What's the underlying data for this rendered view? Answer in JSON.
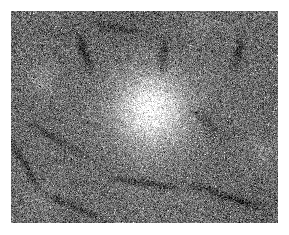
{
  "canvas": {
    "width": 289,
    "height": 235,
    "background_color": "#ffffff"
  },
  "image_panel": {
    "label": "grayscale-speckle-image",
    "x": 11,
    "y": 11,
    "width": 267,
    "height": 212,
    "base_gray_level": 108,
    "speckle_contrast": 78,
    "border_color": "#ffffff",
    "colormap": "grayscale"
  },
  "features": {
    "bright_lesion": {
      "label": "central-bright-lesion",
      "center_x": 150,
      "center_y": 110,
      "radius_x": 36,
      "radius_y": 38,
      "peak_brightness": 216,
      "falloff": "gaussian"
    },
    "bright_halo": {
      "label": "lesion-halo",
      "center_x": 150,
      "center_y": 106,
      "radius_x": 62,
      "radius_y": 60,
      "peak_brightness": 150
    },
    "dark_structures": [
      {
        "label": "dark-streak-upper-left",
        "center_x": 84,
        "center_y": 52,
        "length": 30,
        "thickness": 9,
        "angle_deg": 72,
        "darkness": 56
      },
      {
        "label": "dark-patch-upper-center",
        "center_x": 163,
        "center_y": 55,
        "length": 26,
        "thickness": 11,
        "angle_deg": 95,
        "darkness": 62
      },
      {
        "label": "dark-patch-upper-right",
        "center_x": 238,
        "center_y": 52,
        "length": 26,
        "thickness": 10,
        "angle_deg": 100,
        "darkness": 64
      },
      {
        "label": "dark-streak-left-edge",
        "center_x": 26,
        "center_y": 166,
        "length": 44,
        "thickness": 7,
        "angle_deg": 58,
        "darkness": 58
      },
      {
        "label": "dark-band-lower-center",
        "center_x": 146,
        "center_y": 183,
        "length": 56,
        "thickness": 8,
        "angle_deg": 8,
        "darkness": 60
      },
      {
        "label": "dark-band-lower-right",
        "center_x": 226,
        "center_y": 196,
        "length": 62,
        "thickness": 9,
        "angle_deg": 18,
        "darkness": 62
      },
      {
        "label": "dark-band-mid-left",
        "center_x": 58,
        "center_y": 140,
        "length": 48,
        "thickness": 8,
        "angle_deg": 30,
        "darkness": 70
      },
      {
        "label": "dark-band-lower-left",
        "center_x": 72,
        "center_y": 206,
        "length": 50,
        "thickness": 8,
        "angle_deg": 22,
        "darkness": 68
      },
      {
        "label": "dark-patch-mid-right",
        "center_x": 206,
        "center_y": 122,
        "length": 34,
        "thickness": 12,
        "angle_deg": 45,
        "darkness": 74
      },
      {
        "label": "dark-patch-top-center-left",
        "center_x": 118,
        "center_y": 28,
        "length": 36,
        "thickness": 9,
        "angle_deg": 12,
        "darkness": 76
      }
    ],
    "bright_patches": [
      {
        "label": "bright-patch-upper-left",
        "center_x": 44,
        "center_y": 78,
        "radius": 20,
        "brightness": 138
      },
      {
        "label": "bright-patch-lower-left",
        "center_x": 40,
        "center_y": 198,
        "radius": 18,
        "brightness": 134
      },
      {
        "label": "bright-patch-right",
        "center_x": 262,
        "center_y": 150,
        "radius": 20,
        "brightness": 132
      },
      {
        "label": "bright-patch-top-right",
        "center_x": 200,
        "center_y": 22,
        "radius": 16,
        "brightness": 130
      }
    ]
  }
}
